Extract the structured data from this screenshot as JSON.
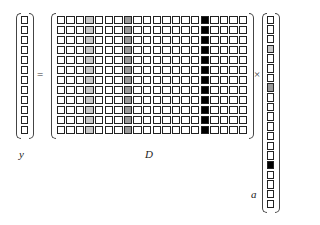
{
  "equation": {
    "equals_sign": "=",
    "times_sign": "×"
  },
  "vector_y": {
    "label": "y",
    "length": 12
  },
  "matrix_D": {
    "label": "D",
    "rows": 12,
    "cols": 20,
    "column_shading": [
      0,
      0,
      0,
      1,
      0,
      0,
      0,
      2,
      0,
      0,
      0,
      0,
      0,
      0,
      0,
      3,
      0,
      0,
      0,
      0
    ]
  },
  "vector_a": {
    "label": "a",
    "length": 20,
    "cell_shading": [
      0,
      0,
      0,
      1,
      0,
      0,
      0,
      2,
      0,
      0,
      0,
      0,
      0,
      0,
      0,
      3,
      0,
      0,
      0,
      0
    ]
  },
  "shading_colors": {
    "0": "#ffffff",
    "1": "#c8c8c8",
    "2": "#9a9a9a",
    "3": "#000000"
  }
}
